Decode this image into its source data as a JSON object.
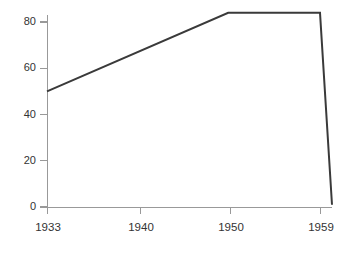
{
  "chart_data": {
    "type": "line",
    "title": "",
    "subtitle": "",
    "xlabel": "",
    "ylabel": "",
    "xlim": [
      1933,
      1960
    ],
    "ylim": [
      0,
      88
    ],
    "grid": false,
    "legend": false,
    "legend_position": "none",
    "x_tick_labels": [
      "1933",
      "1940",
      "1950",
      "1959"
    ],
    "x_ticks": [
      1933,
      1940,
      1950,
      1959
    ],
    "y_tick_labels": [
      "0",
      "20",
      "40",
      "60",
      "80"
    ],
    "y_ticks": [
      0,
      20,
      40,
      60,
      80
    ],
    "series": [
      {
        "name": "series-1",
        "color": "#3a3a3a",
        "x": [
          1933,
          1949.8,
          1959,
          1960.2
        ],
        "values": [
          50,
          84,
          84,
          1
        ]
      }
    ]
  },
  "axes": {
    "axis_color": "#999999",
    "tick_color": "#999999",
    "text_color": "#333333",
    "background_color": "#ffffff"
  },
  "geometry": {
    "plot_left": 47,
    "plot_right": 332,
    "plot_top": 15,
    "plot_bottom": 207,
    "y_pixels": {
      "0": 207,
      "20": 160.75,
      "40": 114.5,
      "60": 68.25,
      "80": 22
    },
    "x_pixels": {
      "1933": 47,
      "1940": 140,
      "1950": 230,
      "1959": 320
    }
  }
}
